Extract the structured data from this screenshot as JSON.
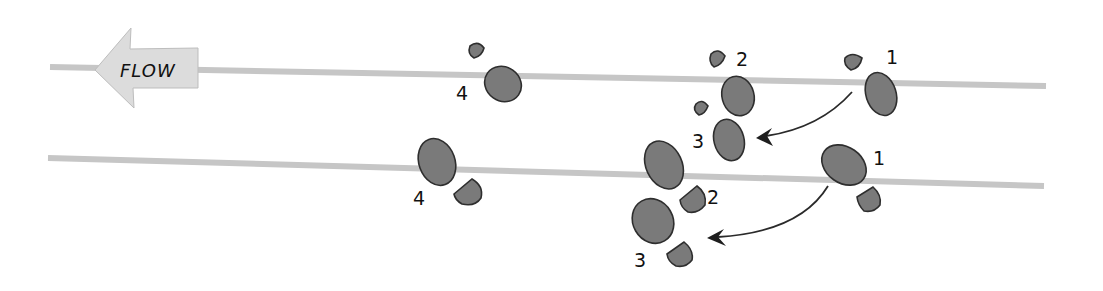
{
  "diagram": {
    "flow_label": "FLOW",
    "lines": [
      {
        "name": "upper-line",
        "x1": 50,
        "y1": 67,
        "x2": 1046,
        "y2": 86
      },
      {
        "name": "lower-line",
        "x1": 48,
        "y1": 158,
        "x2": 1044,
        "y2": 186
      }
    ],
    "upper_step_labels": [
      "1",
      "2",
      "3",
      "4"
    ],
    "lower_step_labels": [
      "1",
      "2",
      "3",
      "4"
    ],
    "colors": {
      "line": "#c6c6c6",
      "footprint_fill": "#7a7a7a",
      "footprint_stroke": "#2e2e2e",
      "flow_arrow": "#dcdcdc",
      "text": "#111111"
    }
  }
}
